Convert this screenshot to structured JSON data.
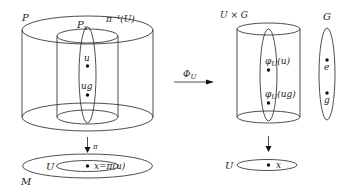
{
  "left": {
    "total_space_label": "P",
    "preimage_label": "π⁻¹(U)",
    "fibre_label": "P",
    "fibre_subscript": "x",
    "point_u": "u",
    "point_ug": "ug",
    "projection_label": "π",
    "base_label": "M",
    "open_set_label": "U",
    "point_x_label": "x=π(u)"
  },
  "map": {
    "label": "Φ",
    "label_subscript": "U"
  },
  "right": {
    "product_label": "U × G",
    "point_phi_u": "φ",
    "point_phi_u_sub": "U",
    "point_phi_u_arg": "(u)",
    "point_phi_ug": "φ",
    "point_phi_ug_sub": "U",
    "point_phi_ug_arg": "(ug)",
    "open_set_label": "U",
    "point_x_label": "x",
    "group_label": "G",
    "group_identity": "e",
    "group_element": "g"
  }
}
